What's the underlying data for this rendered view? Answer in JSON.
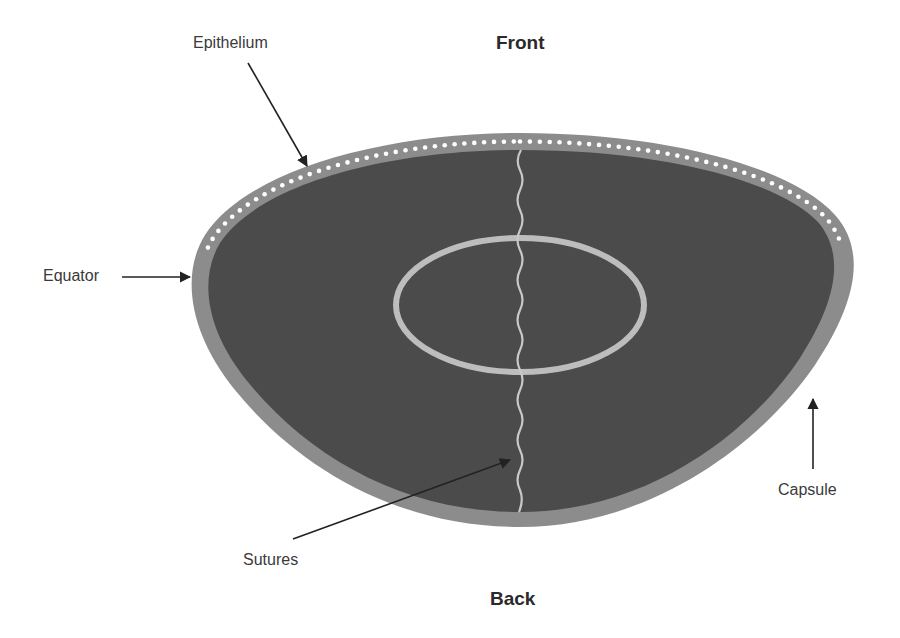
{
  "diagram": {
    "title_top": "Front",
    "title_bottom": "Back",
    "labels": {
      "epithelium": "Epithelium",
      "equator": "Equator",
      "capsule": "Capsule",
      "sutures": "Sutures"
    },
    "colors": {
      "background": "#ffffff",
      "capsule": "#8c8c8c",
      "lens_fill": "#4b4b4b",
      "epithelium_dots": "#ffffff",
      "nucleus_ring": "#bdbdbd",
      "suture_line": "#c8c8c8",
      "arrows": "#222222",
      "text": "#3a3a3a"
    }
  }
}
